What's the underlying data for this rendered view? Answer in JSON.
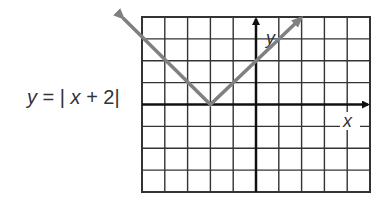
{
  "equation": {
    "lhs": "y",
    "eq": "=",
    "bar_open": "|",
    "var": "x",
    "rest": " + 2",
    "bar_close": "|"
  },
  "graph": {
    "x_label": "x",
    "y_label": "y",
    "grid_columns": 10,
    "grid_rows": 8,
    "x_range": [
      -5,
      5
    ],
    "y_range": [
      -4,
      4
    ],
    "function": "y = |x + 2|",
    "vertex": [
      -2,
      0
    ],
    "colors": {
      "grid": "#333333",
      "axes": "#111111",
      "curve": "#808080"
    }
  }
}
